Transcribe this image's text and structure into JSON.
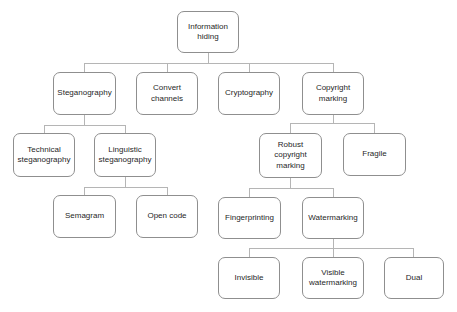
{
  "diagram": {
    "type": "tree",
    "colors": {
      "background": "#ffffff",
      "box_fill": "#ffffff",
      "box_border": "#8f8f8f",
      "connector_line": "#b5b5b5",
      "text": "#1f1f1f"
    },
    "nodes": {
      "information_hiding": "Information hiding",
      "steganography": "Steganography",
      "convert_channels": "Convert channels",
      "cryptography": "Cryptography",
      "copyright_marking": "Copyright marking",
      "technical_steganography": "Technical steganography",
      "linguistic_steganography": "Linguistic steganography",
      "robust_copyright_marking": "Robust copyright marking",
      "fragile": "Fragile",
      "semagram": "Semagram",
      "open_code": "Open code",
      "fingerprinting": "Fingerprinting",
      "watermarking": "Watermarking",
      "invisible": "Invisible",
      "visible_watermarking": "Visible watermarking",
      "dual": "Dual"
    },
    "edges": [
      [
        "information_hiding",
        "steganography"
      ],
      [
        "information_hiding",
        "convert_channels"
      ],
      [
        "information_hiding",
        "cryptography"
      ],
      [
        "information_hiding",
        "copyright_marking"
      ],
      [
        "steganography",
        "technical_steganography"
      ],
      [
        "steganography",
        "linguistic_steganography"
      ],
      [
        "copyright_marking",
        "robust_copyright_marking"
      ],
      [
        "copyright_marking",
        "fragile"
      ],
      [
        "linguistic_steganography",
        "semagram"
      ],
      [
        "linguistic_steganography",
        "open_code"
      ],
      [
        "robust_copyright_marking",
        "fingerprinting"
      ],
      [
        "robust_copyright_marking",
        "watermarking"
      ],
      [
        "watermarking",
        "invisible"
      ],
      [
        "watermarking",
        "visible_watermarking"
      ],
      [
        "watermarking",
        "dual"
      ]
    ]
  }
}
